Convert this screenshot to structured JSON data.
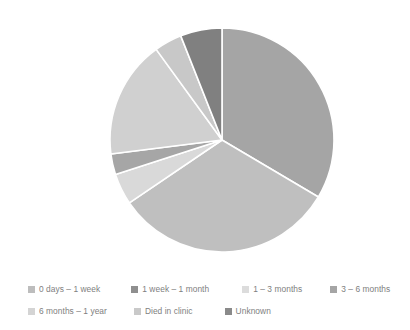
{
  "chart_data": {
    "type": "pie",
    "title": "",
    "legend_position": "bottom",
    "center": [
      222,
      140
    ],
    "radius": 112,
    "start_angle_deg": 0,
    "direction": "clockwise",
    "categories": [
      "0 days – 1 week",
      "1 week – 1 month",
      "1 – 3 months",
      "3 – 6 months",
      "6 months – 1 year",
      "Died in clinic",
      "Unknown"
    ],
    "values": [
      33.5,
      32.0,
      4.5,
      3.0,
      17.0,
      4.0,
      6.0
    ],
    "unit": "percent",
    "colors": [
      "#a5a5a5",
      "#bfbfbf",
      "#d9d9d9",
      "#a6a6a6",
      "#d0d0d0",
      "#c8c8c8",
      "#808080"
    ]
  },
  "legend": {
    "rows": [
      [
        {
          "label": "0 days – 1 week",
          "color": "#bdbdbd",
          "name": "legend-item-0-days-1-week"
        },
        {
          "label": "1 week – 1 month",
          "color": "#8f8f8f",
          "name": "legend-item-1-week-1-month"
        },
        {
          "label": "1 – 3 months",
          "color": "#dcdcdc",
          "name": "legend-item-1-3-months"
        },
        {
          "label": "3 – 6 months",
          "color": "#a5a5a5",
          "name": "legend-item-3-6-months"
        }
      ],
      [
        {
          "label": "6 months – 1 year",
          "color": "#d4d4d4",
          "name": "legend-item-6-months-1-year"
        },
        {
          "label": "Died in clinic",
          "color": "#c9c9c9",
          "name": "legend-item-died-in-clinic"
        },
        {
          "label": "Unknown",
          "color": "#8a8a8a",
          "name": "legend-item-unknown"
        }
      ]
    ]
  },
  "style": {
    "slice_border_color": "#ffffff",
    "slice_border_width": 1.6,
    "background": "#ffffff",
    "legend_text_color": "#808080"
  }
}
